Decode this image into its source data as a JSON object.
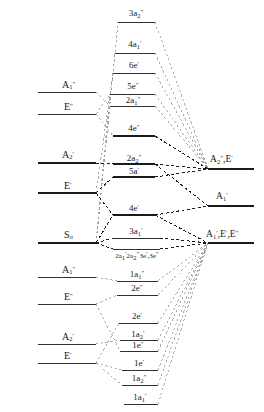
{
  "diagram": {
    "type": "molecular-orbital-correlation-diagram",
    "width": 264,
    "height": 412,
    "background": "#ffffff",
    "line_color": "#1a1a1a",
    "faint_line_color": "#9a9a9a"
  },
  "left_levels": [
    {
      "id": "left-a1dp-upper",
      "label_html": "A<sub>1</sub><sup>″</sup>",
      "symbol": "A1''",
      "x1": 38,
      "x2": 96,
      "y": 92,
      "label_x": 62,
      "label_y": 80,
      "weight": "thin"
    },
    {
      "id": "left-edp-upper",
      "label_html": "E<sup>″</sup>",
      "symbol": "E''",
      "x1": 38,
      "x2": 96,
      "y": 114,
      "label_x": 64,
      "label_y": 102,
      "weight": "thin"
    },
    {
      "id": "left-a2p",
      "label_html": "A<sub>2</sub><sup>′</sup>",
      "symbol": "A2'",
      "x1": 38,
      "x2": 96,
      "y": 163,
      "label_x": 62,
      "label_y": 150,
      "weight": "bold"
    },
    {
      "id": "left-ep",
      "label_html": "E<sup>′</sup>",
      "symbol": "E'",
      "x1": 38,
      "x2": 96,
      "y": 193,
      "label_x": 64,
      "label_y": 181,
      "weight": "bold"
    },
    {
      "id": "left-sigma",
      "label_html": "S<sub>σ</sub>",
      "symbol": "S_sigma",
      "x1": 38,
      "x2": 96,
      "y": 243,
      "label_x": 64,
      "label_y": 230,
      "weight": "bold"
    },
    {
      "id": "left-a1dp-lower",
      "label_html": "A<sub>1</sub><sup>″</sup>",
      "symbol": "A1''",
      "x1": 38,
      "x2": 96,
      "y": 277,
      "label_x": 62,
      "label_y": 265,
      "weight": "thin"
    },
    {
      "id": "left-edp-lower",
      "label_html": "E<sup>″</sup>",
      "symbol": "E''",
      "x1": 38,
      "x2": 96,
      "y": 304,
      "label_x": 64,
      "label_y": 292,
      "weight": "thin"
    },
    {
      "id": "left-a2p-lower",
      "label_html": "A<sub>2</sub><sup>′</sup>",
      "symbol": "A2'",
      "x1": 38,
      "x2": 96,
      "y": 344,
      "label_x": 62,
      "label_y": 332,
      "weight": "thin"
    },
    {
      "id": "left-ep-lower",
      "label_html": "E<sup>′</sup>",
      "symbol": "E'",
      "x1": 38,
      "x2": 96,
      "y": 363,
      "label_x": 64,
      "label_y": 351,
      "weight": "thin"
    }
  ],
  "center_levels": [
    {
      "id": "mo-3a2dp",
      "label_html": "3a<sub>2</sub><sup>″</sup>",
      "symbol": "3a2''",
      "x1": 118,
      "x2": 155,
      "y": 22,
      "label_x": 136,
      "label_y": 9,
      "weight": "thin"
    },
    {
      "id": "mo-4a1p",
      "label_html": "4a<sub>1</sub><sup>′</sup>",
      "symbol": "4a1'",
      "x1": 115,
      "x2": 155,
      "y": 53,
      "label_x": 135,
      "label_y": 40,
      "weight": "thin"
    },
    {
      "id": "mo-6ep",
      "label_html": "6e<sup>′</sup>",
      "symbol": "6e'",
      "x1": 113,
      "x2": 155,
      "y": 73,
      "label_x": 134,
      "label_y": 61,
      "weight": "thin"
    },
    {
      "id": "mo-5edp",
      "label_html": "5e<sup>″</sup>",
      "symbol": "5e''",
      "x1": 110,
      "x2": 155,
      "y": 94,
      "label_x": 133,
      "label_y": 82,
      "weight": "thin"
    },
    {
      "id": "mo-2a1dp",
      "label_html": "2a<sub>1</sub><sup>″</sup>",
      "symbol": "2a1''",
      "x1": 110,
      "x2": 155,
      "y": 106,
      "label_x": 133,
      "label_y": 96,
      "weight": "thin"
    },
    {
      "id": "mo-4edp",
      "label_html": "4e<sup>″</sup>",
      "symbol": "4e''",
      "x1": 113,
      "x2": 155,
      "y": 136,
      "label_x": 134,
      "label_y": 124,
      "weight": "bold"
    },
    {
      "id": "mo-2a2dp",
      "label_html": "2a<sub>2</sub><sup>″</sup>",
      "symbol": "2a2''",
      "x1": 113,
      "x2": 155,
      "y": 164,
      "label_x": 134,
      "label_y": 154,
      "weight": "bold"
    },
    {
      "id": "mo-5ap",
      "label_html": "5a<sup>′</sup>",
      "symbol": "5a'",
      "x1": 113,
      "x2": 155,
      "y": 177,
      "label_x": 134,
      "label_y": 167,
      "weight": "bold"
    },
    {
      "id": "mo-4ep",
      "label_html": "4e<sup>′</sup>",
      "symbol": "4e'",
      "x1": 113,
      "x2": 155,
      "y": 215,
      "label_x": 134,
      "label_y": 204,
      "weight": "bold"
    },
    {
      "id": "mo-3a1p",
      "label_html": "3a<sub>1</sub><sup>′</sup>",
      "symbol": "3a1'",
      "x1": 113,
      "x2": 160,
      "y": 238,
      "label_x": 136,
      "label_y": 227,
      "weight": "thin"
    },
    {
      "id": "mo-combo",
      "label_html": "2a<sub>1</sub><sup>′</sup>2a<sub>2</sub><sup>″</sup>3e<sup>′</sup>,3e<sup>″</sup>",
      "symbol": "2a1'2a2''3e'3e''",
      "x1": 113,
      "x2": 160,
      "y": 249,
      "label_x": 137,
      "label_y": 251,
      "weight": "thin"
    },
    {
      "id": "mo-1a1dp",
      "label_html": "1a<sub>1</sub><sup>″</sup>",
      "symbol": "1a1''",
      "x1": 117,
      "x2": 158,
      "y": 281,
      "label_x": 137,
      "label_y": 270,
      "weight": "thin"
    },
    {
      "id": "mo-2edp",
      "label_html": "2e<sup>″</sup>",
      "symbol": "2e''",
      "x1": 117,
      "x2": 158,
      "y": 295,
      "label_x": 137,
      "label_y": 284,
      "weight": "thin"
    },
    {
      "id": "mo-2ep",
      "label_html": "2e<sup>′</sup>",
      "symbol": "2e'",
      "x1": 119,
      "x2": 158,
      "y": 323,
      "label_x": 137,
      "label_y": 312,
      "weight": "thin"
    },
    {
      "id": "mo-1a2p",
      "label_html": "1a<sub>2</sub><sup>′</sup>",
      "symbol": "1a2'",
      "x1": 120,
      "x2": 158,
      "y": 340,
      "label_x": 138,
      "label_y": 330,
      "weight": "thin"
    },
    {
      "id": "mo-1edp",
      "label_html": "1e<sup>″</sup>",
      "symbol": "1e''",
      "x1": 120,
      "x2": 158,
      "y": 351,
      "label_x": 138,
      "label_y": 341,
      "weight": "thin"
    },
    {
      "id": "mo-1ep",
      "label_html": "1e<sup>′</sup>",
      "symbol": "1e'",
      "x1": 122,
      "x2": 158,
      "y": 370,
      "label_x": 139,
      "label_y": 359,
      "weight": "thin"
    },
    {
      "id": "mo-1a2dp",
      "label_html": "1a<sub>2</sub><sup>″</sup>",
      "symbol": "1a2''",
      "x1": 122,
      "x2": 158,
      "y": 385,
      "label_x": 139,
      "label_y": 374,
      "weight": "thin"
    },
    {
      "id": "mo-1a1p",
      "label_html": "1a<sub>1</sub><sup>′</sup>",
      "symbol": "1a1'",
      "x1": 124,
      "x2": 158,
      "y": 404,
      "label_x": 140,
      "label_y": 393,
      "weight": "thin"
    }
  ],
  "right_levels": [
    {
      "id": "right-a2dp-ep",
      "label_html": "A<sub>2</sub><sup>″</sup>,E<sup>′</sup>",
      "symbol": "A2'',E'",
      "x1": 208,
      "x2": 254,
      "y": 169,
      "label_x": 210,
      "label_y": 155,
      "weight": "bold"
    },
    {
      "id": "right-a1p",
      "label_html": "A<sub>1</sub><sup>′</sup>",
      "symbol": "A1'",
      "x1": 208,
      "x2": 254,
      "y": 206,
      "label_x": 216,
      "label_y": 192,
      "weight": "bold"
    },
    {
      "id": "right-a1p-ep-edp",
      "label_html": "A<sub>1</sub><sup>′</sup>,E<sup>′</sup>,E<sup>″</sup>",
      "symbol": "A1',E',E''",
      "x1": 208,
      "x2": 254,
      "y": 243,
      "label_x": 206,
      "label_y": 230,
      "weight": "bold"
    }
  ],
  "correlation_lines": {
    "left_nodes": [
      {
        "id": "node-left-upper",
        "x": 96,
        "y": 114
      },
      {
        "id": "node-left-a2p",
        "x": 96,
        "y": 163
      },
      {
        "id": "node-left-ep",
        "x": 96,
        "y": 193
      },
      {
        "id": "node-left-sigma",
        "x": 96,
        "y": 243
      },
      {
        "id": "node-left-lower-a1dp",
        "x": 96,
        "y": 277
      },
      {
        "id": "node-left-lower-edp",
        "x": 96,
        "y": 304
      },
      {
        "id": "node-left-lower-a2p",
        "x": 96,
        "y": 344
      },
      {
        "id": "node-left-lower-ep",
        "x": 96,
        "y": 363
      }
    ],
    "right_nodes": [
      {
        "id": "node-right-a2dp",
        "x": 208,
        "y": 169
      },
      {
        "id": "node-right-a1p",
        "x": 208,
        "y": 206
      },
      {
        "id": "node-right-triple",
        "x": 208,
        "y": 243
      }
    ]
  }
}
